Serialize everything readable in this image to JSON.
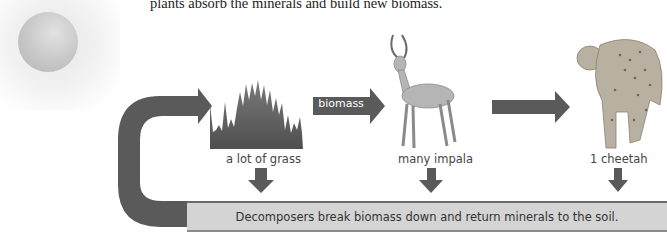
{
  "caption": "plants absorb the minerals and build new biomass.",
  "sun": {
    "icon": "sun-icon"
  },
  "organisms": [
    {
      "label": "a lot of grass",
      "icon": "grass-icon"
    },
    {
      "label": "many impala",
      "icon": "impala-icon"
    },
    {
      "label": "1 cheetah",
      "icon": "cheetah-icon"
    }
  ],
  "arrows": {
    "biomass_label": "biomass"
  },
  "decomposers": {
    "text": "Decomposers break biomass down and return minerals to the soil."
  },
  "colors": {
    "arrow": "#5a5a5a",
    "bar": "#d4d4d4",
    "grass": "#5a5a5a"
  }
}
